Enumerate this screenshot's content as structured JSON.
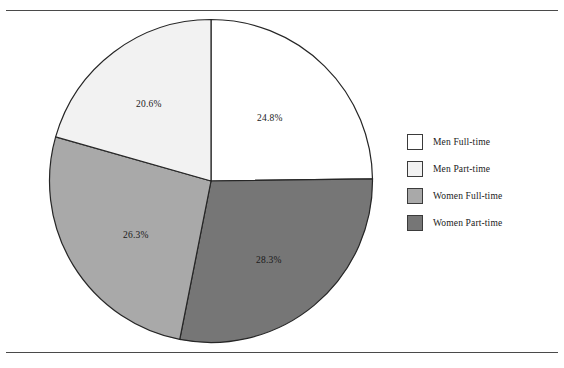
{
  "chart_data": {
    "type": "pie",
    "title": "",
    "subtitle": "",
    "xlabel": "",
    "ylabel": "",
    "legend_position": "right",
    "grid": false,
    "start_angle_deg": 0,
    "direction": "clockwise",
    "categories": [
      "Men Full-time",
      "Women Part-time",
      "Women Full-time",
      "Men Part-time"
    ],
    "values": [
      24.8,
      28.3,
      26.3,
      20.6
    ],
    "value_suffix": "%",
    "slices": [
      {
        "label": "Men Full-time",
        "value": 24.8,
        "value_text": "24.8%",
        "color": "#ffffff",
        "edge_color": "#262626",
        "start_deg": 0,
        "end_deg": 89.28
      },
      {
        "label": "Women Part-time",
        "value": 28.3,
        "value_text": "28.3%",
        "color": "#767676",
        "edge_color": "#262626",
        "start_deg": 89.28,
        "end_deg": 191.16
      },
      {
        "label": "Women Full-time",
        "value": 26.3,
        "value_text": "26.3%",
        "color": "#a9a9a9",
        "edge_color": "#262626",
        "start_deg": 191.16,
        "end_deg": 285.84
      },
      {
        "label": "Men Part-time",
        "value": 20.6,
        "value_text": "20.6%",
        "color": "#f2f2f2",
        "edge_color": "#262626",
        "start_deg": 285.84,
        "end_deg": 360
      }
    ]
  },
  "pie_labels": {
    "men_full_time": "24.8%",
    "women_part_time": "28.3%",
    "women_full_time": "26.3%",
    "men_part_time": "20.6%"
  },
  "legend": {
    "items": [
      {
        "label": "Men Full-time",
        "color": "#ffffff"
      },
      {
        "label": "Men Part-time",
        "color": "#f2f2f2"
      },
      {
        "label": "Women Full-time",
        "color": "#a9a9a9"
      },
      {
        "label": "Women Part-time",
        "color": "#767676"
      }
    ]
  },
  "colors": {
    "rule": "#4a4a4a",
    "slice_edge": "#262626",
    "text": "#1a1a1a",
    "background": "#ffffff"
  }
}
